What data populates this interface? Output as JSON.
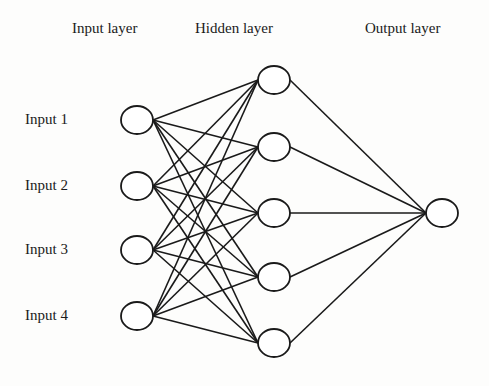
{
  "headers": {
    "input": "Input layer",
    "hidden": "Hidden layer",
    "output": "Output layer"
  },
  "inputs": [
    "Input 1",
    "Input 2",
    "Input 3",
    "Input 4"
  ],
  "layers": {
    "input_count": 4,
    "hidden_count": 5,
    "output_count": 1
  },
  "colors": {
    "stroke": "#1a1a1a",
    "node_fill": "#ffffff"
  }
}
